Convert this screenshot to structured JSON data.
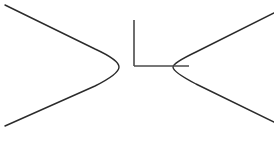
{
  "diagram": {
    "colors": {
      "background": "#ffffff",
      "stroke": "#2b2b2b",
      "axis": "#4a4a4a"
    },
    "left_branch": {
      "start": [
        5,
        5
      ],
      "vertex": [
        119,
        67
      ],
      "end": [
        5,
        126
      ]
    },
    "right_branch": {
      "start": [
        274,
        13
      ],
      "vertex": [
        173,
        67
      ],
      "end": [
        274,
        122
      ]
    },
    "axis_marker": {
      "vertical": {
        "x": 134,
        "y1": 20,
        "y2": 66
      },
      "horizontal": {
        "y": 66,
        "x1": 134,
        "x2": 189
      }
    }
  }
}
